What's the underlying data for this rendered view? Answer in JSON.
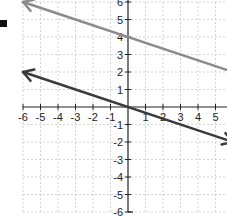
{
  "chart_data": {
    "type": "line",
    "title": "",
    "xlabel": "",
    "ylabel": "",
    "xlim": [
      -6,
      6
    ],
    "ylim": [
      -6,
      6
    ],
    "grid": true,
    "x_tick_labels": [
      "-6",
      "-5",
      "-4",
      "-3",
      "-2",
      "-1",
      "1",
      "2",
      "3",
      "4",
      "5"
    ],
    "y_tick_labels": [
      "6",
      "5",
      "4",
      "3",
      "2",
      "1",
      "-1",
      "-2",
      "-3",
      "-4",
      "-5",
      "-6"
    ],
    "series": [
      {
        "name": "line-upper",
        "equation": "y = -1/3 x + 4",
        "color": "#8a8a8a",
        "points": [
          [
            -6,
            6
          ],
          [
            0,
            4
          ],
          [
            6,
            2
          ]
        ],
        "arrows": [
          "left"
        ]
      },
      {
        "name": "line-lower",
        "equation": "y = -1/3 x",
        "color": "#3a3a3a",
        "points": [
          [
            -6,
            2
          ],
          [
            0,
            0
          ],
          [
            6,
            -2
          ]
        ],
        "arrows": [
          "left",
          "right"
        ]
      }
    ]
  },
  "colors": {
    "grid": "#c8c8c8",
    "axis": "#222222",
    "marker": "#111111"
  }
}
